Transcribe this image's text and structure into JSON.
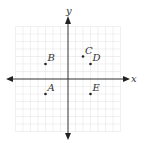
{
  "diagram": {
    "type": "coordinate-plane",
    "axes": {
      "x_label": "x",
      "y_label": "y"
    },
    "grid": {
      "units_each_side": 7,
      "spacing_px": 7.5
    },
    "colors": {
      "axis": "#333333",
      "grid": "#e6e6e6",
      "point": "#222222",
      "label": "#333333"
    },
    "points": [
      {
        "name": "A",
        "x": -3,
        "y": -2
      },
      {
        "name": "B",
        "x": -3,
        "y": 2
      },
      {
        "name": "C",
        "x": 2,
        "y": 3
      },
      {
        "name": "D",
        "x": 3,
        "y": 2
      },
      {
        "name": "E",
        "x": 3,
        "y": -2
      }
    ]
  }
}
